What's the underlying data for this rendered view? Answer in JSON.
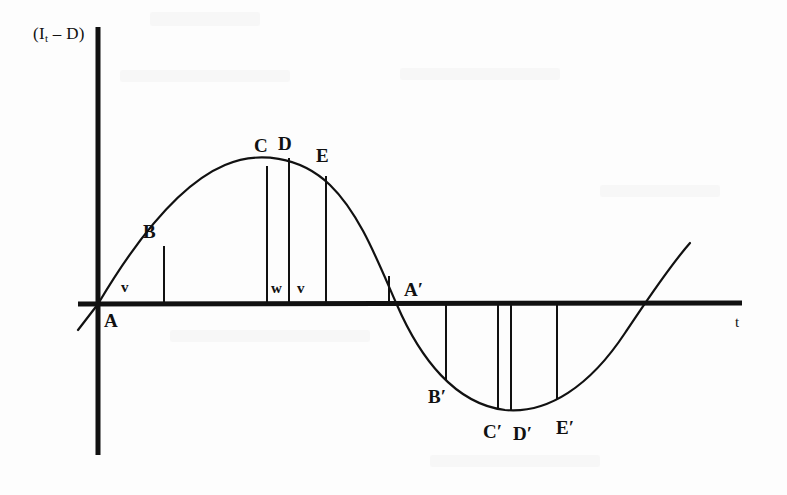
{
  "figure": {
    "type": "diagram",
    "background_color": "#fdfdfd",
    "line_color": "#111111",
    "axes": {
      "y_axis_label": "(I",
      "y_axis_label_sub": "t",
      "y_axis_label_tail": " – D)",
      "y_axis_label_full": "(I t – D)",
      "x_axis_label": "t",
      "y_axis_x": 98,
      "y_axis_top": 27,
      "y_axis_bottom": 455,
      "x_axis_y": 304,
      "x_axis_left": 78,
      "x_axis_right": 742,
      "axis_stroke_width": 5
    },
    "curve": {
      "stroke_width": 2.2,
      "path": "M 78,330 L 98,304 C 130,250 175,186 225,165 C 258,151 300,156 330,185 C 360,214 378,262 397,305 C 420,358 455,404 505,410 C 548,414 590,386 625,333 C 648,299 668,268 690,243",
      "zero_crossings": [
        98,
        397,
        648
      ],
      "peak": {
        "x": 288,
        "y": 158
      },
      "trough": {
        "x": 505,
        "y": 410
      }
    },
    "point_markers": [
      {
        "name": "A",
        "label": "A",
        "label_x": 104,
        "label_y": 311,
        "has_drop_line": false,
        "drop_x": 98,
        "drop_y_top": 304
      },
      {
        "name": "B",
        "label": "B",
        "label_x": 143,
        "label_y": 222,
        "has_drop_line": true,
        "drop_x": 164,
        "drop_y_top": 246
      },
      {
        "name": "C",
        "label": "C",
        "label_x": 254,
        "label_y": 136,
        "has_drop_line": true,
        "drop_x": 267,
        "drop_y_top": 166
      },
      {
        "name": "D",
        "label": "D",
        "label_x": 278,
        "label_y": 134,
        "has_drop_line": true,
        "drop_x": 289,
        "drop_y_top": 158
      },
      {
        "name": "E",
        "label": "E",
        "label_x": 316,
        "label_y": 146,
        "has_drop_line": true,
        "drop_x": 326,
        "drop_y_top": 176
      },
      {
        "name": "A'",
        "label": "A′",
        "label_x": 404,
        "label_y": 280,
        "has_drop_line": true,
        "drop_x": 389,
        "drop_y_top": 276
      },
      {
        "name": "B'",
        "label": "B′",
        "label_x": 428,
        "label_y": 387,
        "has_drop_line": true,
        "drop_x": 446,
        "drop_y_bottom": 380
      },
      {
        "name": "C'",
        "label": "C′",
        "label_x": 483,
        "label_y": 422,
        "has_drop_line": true,
        "drop_x": 498,
        "drop_y_bottom": 409
      },
      {
        "name": "D'",
        "label": "D′",
        "label_x": 513,
        "label_y": 424,
        "has_drop_line": true,
        "drop_x": 511,
        "drop_y_bottom": 411
      },
      {
        "name": "E'",
        "label": "E′",
        "label_x": 556,
        "label_y": 418,
        "has_drop_line": true,
        "drop_x": 557,
        "drop_y_bottom": 399
      }
    ],
    "interval_labels": [
      {
        "name": "v-first",
        "label": "v",
        "x": 121,
        "y": 280
      },
      {
        "name": "w-middle",
        "label": "w",
        "x": 271,
        "y": 281
      },
      {
        "name": "v-second",
        "label": "v",
        "x": 297,
        "y": 281
      }
    ],
    "drop_lines_below": [
      {
        "name": "b-prime-line",
        "x": 446,
        "y_top": 304,
        "y_bottom": 380
      },
      {
        "name": "c-prime-line",
        "x": 498,
        "y_top": 304,
        "y_bottom": 409
      },
      {
        "name": "d-prime-line",
        "x": 511,
        "y_top": 304,
        "y_bottom": 411
      },
      {
        "name": "e-prime-line",
        "x": 557,
        "y_top": 304,
        "y_bottom": 399
      }
    ],
    "drop_lines_above": [
      {
        "name": "b-line",
        "x": 164,
        "y_top": 246,
        "y_bottom": 304
      },
      {
        "name": "c-line",
        "x": 267,
        "y_top": 166,
        "y_bottom": 304
      },
      {
        "name": "d-line",
        "x": 289,
        "y_top": 158,
        "y_bottom": 304
      },
      {
        "name": "e-line",
        "x": 326,
        "y_top": 176,
        "y_bottom": 304
      },
      {
        "name": "a-prime-line",
        "x": 389,
        "y_top": 276,
        "y_bottom": 304
      }
    ],
    "x_axis_label_pos": {
      "x": 735,
      "y": 315
    }
  }
}
